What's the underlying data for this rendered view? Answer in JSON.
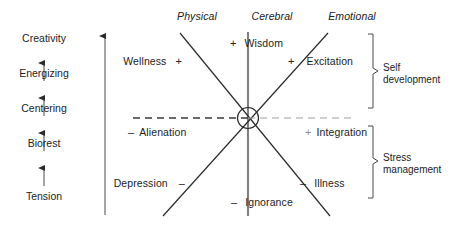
{
  "figure": {
    "title": "",
    "axis_headers": [
      {
        "name": "physical",
        "label": "Physical"
      },
      {
        "name": "cerebral",
        "label": "Cerebral"
      },
      {
        "name": "emotional",
        "label": "Emotional"
      }
    ],
    "ladder": {
      "name": "progression-ladder",
      "direction": "upward",
      "steps_bottom_to_top": [
        "Tension",
        "Biorest",
        "Centering",
        "Energizing",
        "Creativity"
      ],
      "labels": {
        "creativity": "Creativity",
        "energizing": "Energizing",
        "centering": "Centering",
        "biorest": "Biorest",
        "tension": "Tension"
      }
    },
    "poles": {
      "wellness": {
        "label": "Wellness",
        "sign": "+",
        "axis": "physical",
        "position": "upper-left"
      },
      "wisdom": {
        "label": "Wisdom",
        "sign": "+",
        "axis": "cerebral",
        "position": "top"
      },
      "excitation": {
        "label": "Excitation",
        "sign": "+",
        "axis": "emotional",
        "position": "upper-right"
      },
      "alienation": {
        "label": "Alienation",
        "sign": "–",
        "axis": "neutral",
        "position": "middle-left"
      },
      "integration": {
        "label": "Integration",
        "sign": "+",
        "axis": "neutral",
        "position": "middle-right"
      },
      "depression": {
        "label": "Depression",
        "sign": "–",
        "axis": "physical",
        "position": "lower-left"
      },
      "ignorance": {
        "label": "Ignorance",
        "sign": "–",
        "axis": "cerebral",
        "position": "bottom"
      },
      "illness": {
        "label": "Illness",
        "sign": "–",
        "axis": "emotional",
        "position": "lower-right"
      }
    },
    "brackets": [
      {
        "name": "self-development",
        "line1": "Self",
        "line2": "development",
        "covers": "upper-half"
      },
      {
        "name": "stress-management",
        "line1": "Stress",
        "line2": "management",
        "covers": "lower-half"
      }
    ],
    "colors": {
      "ink": "#1d1d1d",
      "line": "#2b2b2b",
      "dashed_line_left": "#3a3a3a",
      "dashed_line_right": "#9a9a9a",
      "background": "#ffffff"
    }
  }
}
